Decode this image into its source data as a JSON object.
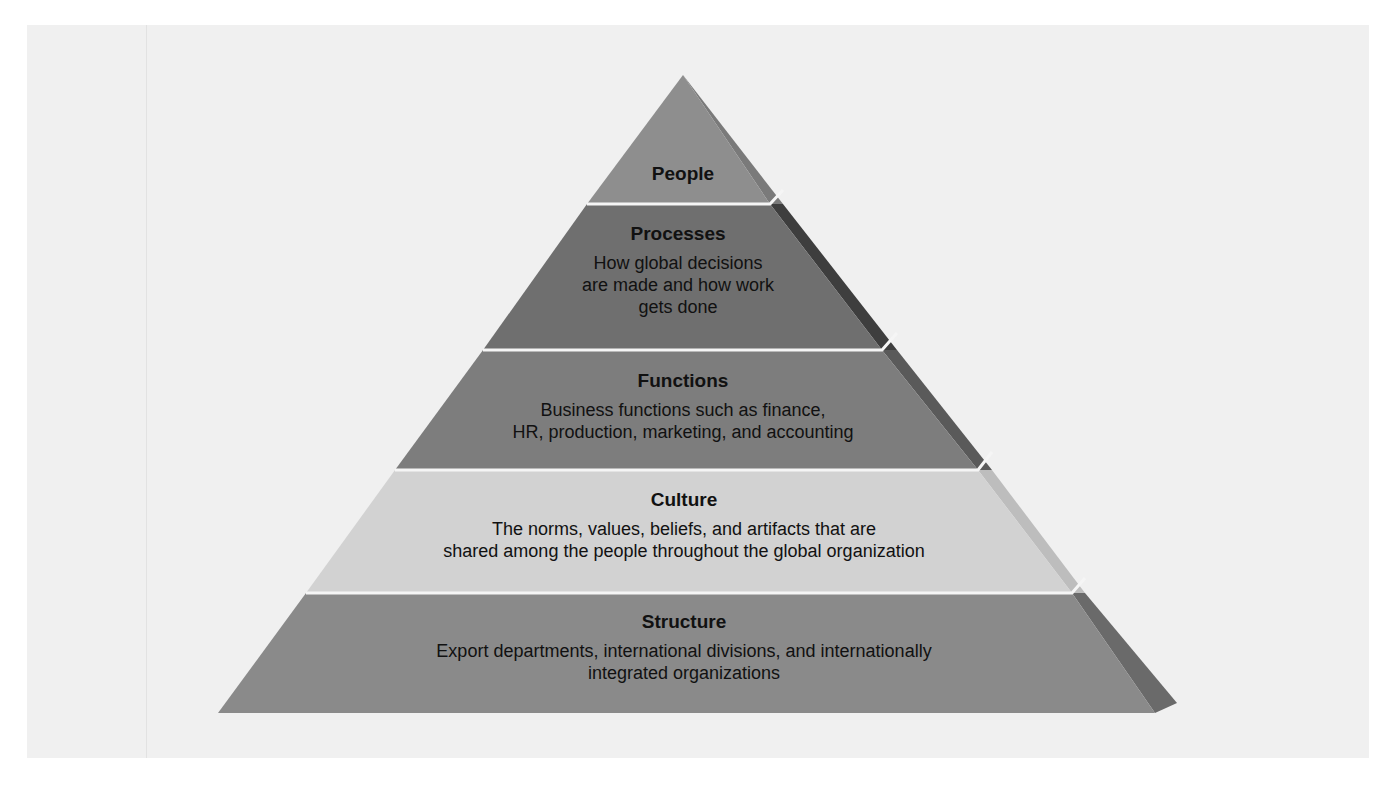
{
  "diagram": {
    "type": "pyramid",
    "colors": {
      "background": "#f0f0f0",
      "people_front": "#8e8e8e",
      "people_side": "#7a7a7a",
      "processes_front": "#6f6f6f",
      "processes_side": "#3e3e3e",
      "functions_front": "#7d7d7d",
      "functions_side": "#5a5a5a",
      "culture_front": "#d2d2d2",
      "culture_side": "#bdbdbd",
      "structure_front": "#8a8a8a",
      "structure_side": "#6a6a6a",
      "separator": "#f5f5f5"
    },
    "levels": [
      {
        "title": "People",
        "description": []
      },
      {
        "title": "Processes",
        "description": [
          "How global decisions",
          "are made and how work",
          "gets done"
        ]
      },
      {
        "title": "Functions",
        "description": [
          "Business functions such as finance,",
          "HR, production, marketing, and accounting"
        ]
      },
      {
        "title": "Culture",
        "description": [
          "The norms, values, beliefs, and artifacts that are",
          "shared among the people throughout the global organization"
        ]
      },
      {
        "title": "Structure",
        "description": [
          "Export departments, international divisions, and internationally",
          "integrated organizations"
        ]
      }
    ]
  }
}
